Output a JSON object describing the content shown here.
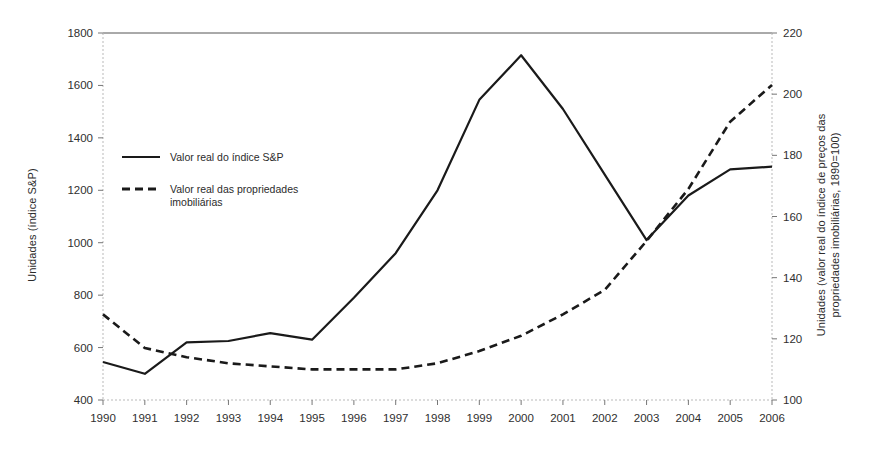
{
  "chart_data": {
    "type": "line",
    "title": "",
    "xlabel": "",
    "ylabel": "Unidades (índice S&P)",
    "ylabel_right": "Unidades (valor real do índice de preços das propriedades imobiliárias, 1890=100)",
    "grid": false,
    "legend_position": "upper-left-inside",
    "x": [
      1990,
      1991,
      1992,
      1993,
      1994,
      1995,
      1996,
      1997,
      1998,
      1999,
      2000,
      2001,
      2002,
      2003,
      2004,
      2005,
      2006
    ],
    "categories": [
      "1990",
      "1991",
      "1992",
      "1993",
      "1994",
      "1995",
      "1996",
      "1997",
      "1998",
      "1999",
      "2000",
      "2001",
      "2002",
      "2003",
      "2004",
      "2005",
      "2006"
    ],
    "ylim": [
      400,
      1800
    ],
    "yticks": [
      400,
      600,
      800,
      1000,
      1200,
      1400,
      1600,
      1800
    ],
    "ylim_right": [
      100,
      220
    ],
    "yticks_right": [
      100,
      120,
      140,
      160,
      180,
      200,
      220
    ],
    "series": [
      {
        "name": "Valor real do índice S&P",
        "axis": "left",
        "style": "solid",
        "color": "#1a1a1a",
        "values": [
          545,
          500,
          620,
          625,
          655,
          630,
          790,
          960,
          1200,
          1545,
          1715,
          1510,
          1260,
          1010,
          1180,
          1280,
          1290
        ]
      },
      {
        "name": "Valor real das propriedades imobiliárias",
        "axis": "right",
        "style": "dashed",
        "color": "#1a1a1a",
        "values": [
          128,
          117,
          114,
          112,
          111,
          110,
          110,
          110,
          112,
          116,
          121,
          128,
          136,
          152,
          169,
          191,
          203
        ]
      }
    ]
  },
  "legend": {
    "items": [
      {
        "label": "Valor real do índice S&P",
        "style": "solid"
      },
      {
        "label": "Valor real das propriedades",
        "label2": "imobiliárias",
        "style": "dashed"
      }
    ]
  },
  "axes": {
    "left_title": "Unidades (índice S&P)",
    "right_title_line1": "Unidades (valor real do índice de preços das",
    "right_title_line2": "propriedades imobiliárias, 1890=100)"
  }
}
